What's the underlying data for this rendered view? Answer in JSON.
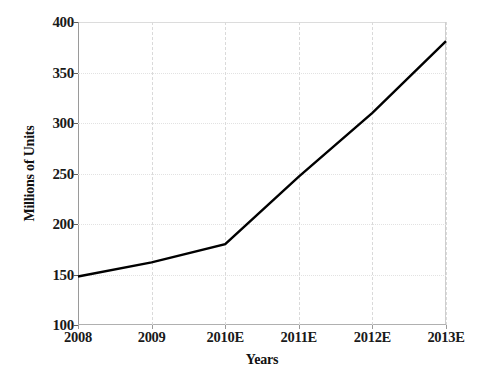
{
  "chart_data": {
    "type": "line",
    "title": "",
    "xlabel": "Years",
    "ylabel": "Millions of Units",
    "categories": [
      "2008",
      "2009",
      "2010E",
      "2011E",
      "2012E",
      "2013E"
    ],
    "x": [
      2008,
      2009,
      2010,
      2011,
      2012,
      2013
    ],
    "values": [
      148,
      162,
      180,
      247,
      310,
      381
    ],
    "series": [
      {
        "name": "Units",
        "values": [
          148,
          162,
          180,
          247,
          310,
          381
        ]
      }
    ],
    "ylim": [
      100,
      400
    ],
    "yticks": [
      100,
      150,
      200,
      250,
      300,
      350,
      400
    ],
    "ytick_labels": [
      "100",
      "150",
      "200",
      "250",
      "300",
      "350",
      "400"
    ],
    "xtick_labels": [
      "2008",
      "2009",
      "2010E",
      "2011E",
      "2012E",
      "2013E"
    ],
    "grid": true,
    "grid_style": "dotted",
    "legend": "none",
    "line_color": "#000000",
    "grid_color": "#e2e2e2",
    "axis_color": "#9a9a9a",
    "text_color": "#1a1a1a",
    "background_color": "#ffffff"
  }
}
